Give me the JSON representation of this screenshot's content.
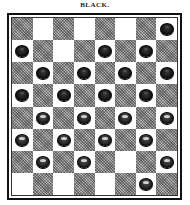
{
  "title": "BLACK.",
  "board": {
    "rows": 8,
    "cols": 8,
    "light_color": "#ffffff",
    "dark_color": "#8a8a8a",
    "pieces": [
      {
        "row": 0,
        "col": 7,
        "color": "black"
      },
      {
        "row": 1,
        "col": 0,
        "color": "black"
      },
      {
        "row": 1,
        "col": 4,
        "color": "black"
      },
      {
        "row": 1,
        "col": 6,
        "color": "black"
      },
      {
        "row": 2,
        "col": 1,
        "color": "black"
      },
      {
        "row": 2,
        "col": 3,
        "color": "black"
      },
      {
        "row": 2,
        "col": 5,
        "color": "black"
      },
      {
        "row": 2,
        "col": 7,
        "color": "black"
      },
      {
        "row": 3,
        "col": 0,
        "color": "black"
      },
      {
        "row": 3,
        "col": 2,
        "color": "black"
      },
      {
        "row": 3,
        "col": 4,
        "color": "black"
      },
      {
        "row": 3,
        "col": 6,
        "color": "black"
      },
      {
        "row": 4,
        "col": 1,
        "color": "white"
      },
      {
        "row": 4,
        "col": 3,
        "color": "white"
      },
      {
        "row": 4,
        "col": 5,
        "color": "white"
      },
      {
        "row": 4,
        "col": 7,
        "color": "white"
      },
      {
        "row": 5,
        "col": 0,
        "color": "white"
      },
      {
        "row": 5,
        "col": 2,
        "color": "white"
      },
      {
        "row": 5,
        "col": 4,
        "color": "white"
      },
      {
        "row": 5,
        "col": 6,
        "color": "white"
      },
      {
        "row": 6,
        "col": 1,
        "color": "white"
      },
      {
        "row": 6,
        "col": 3,
        "color": "white"
      },
      {
        "row": 6,
        "col": 7,
        "color": "white"
      },
      {
        "row": 7,
        "col": 6,
        "color": "white"
      }
    ]
  }
}
